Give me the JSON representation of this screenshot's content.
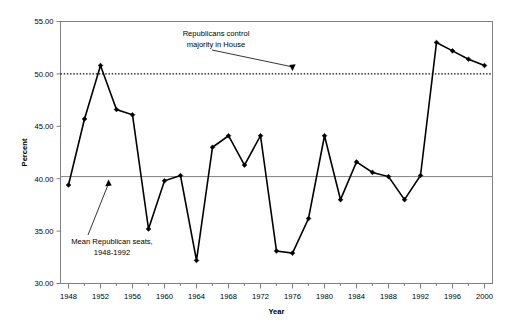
{
  "chart_data": {
    "type": "line",
    "title": "",
    "xlabel": "Year",
    "ylabel": "Percent",
    "xlim": [
      1947,
      2001
    ],
    "ylim": [
      30.0,
      55.0
    ],
    "grid": false,
    "legend_position": "none",
    "x": [
      1948,
      1950,
      1952,
      1954,
      1956,
      1958,
      1960,
      1962,
      1964,
      1966,
      1968,
      1970,
      1972,
      1974,
      1976,
      1978,
      1980,
      1982,
      1984,
      1986,
      1988,
      1990,
      1992,
      1994,
      1996,
      1998,
      2000
    ],
    "values": [
      39.4,
      45.7,
      50.8,
      46.6,
      46.1,
      35.2,
      39.8,
      40.3,
      32.2,
      43.0,
      44.1,
      41.3,
      44.1,
      33.1,
      32.9,
      36.2,
      44.1,
      38.0,
      41.6,
      40.6,
      40.2,
      38.0,
      40.3,
      53.0,
      52.2,
      51.4,
      50.8
    ],
    "series": [
      {
        "name": "Republican seats in House (percent)",
        "values": [
          39.4,
          45.7,
          50.8,
          46.6,
          46.1,
          35.2,
          39.8,
          40.3,
          32.2,
          43.0,
          44.1,
          41.3,
          44.1,
          33.1,
          32.9,
          36.2,
          44.1,
          38.0,
          41.6,
          40.6,
          40.2,
          38.0,
          40.3,
          53.0,
          52.2,
          51.4,
          50.8
        ]
      }
    ],
    "y_ticks": [
      "30.00",
      "35.00",
      "40.00",
      "45.00",
      "50.00",
      "55.00"
    ],
    "y_tick_values": [
      30.0,
      35.0,
      40.0,
      45.0,
      50.0,
      55.0
    ],
    "x_ticks": [
      "1948",
      "1952",
      "1956",
      "1960",
      "1964",
      "1968",
      "1972",
      "1976",
      "1980",
      "1984",
      "1988",
      "1992",
      "1996",
      "2000"
    ],
    "x_tick_values": [
      1948,
      1952,
      1956,
      1960,
      1964,
      1968,
      1972,
      1976,
      1980,
      1984,
      1988,
      1992,
      1996,
      2000
    ],
    "reference_lines": [
      {
        "name": "majority-line",
        "value": 50.0,
        "style": "dotted",
        "color": "#000000"
      },
      {
        "name": "mean-line",
        "value": 40.2,
        "style": "solid",
        "color": "#808080"
      }
    ],
    "annotations": [
      {
        "name": "majority-annotation",
        "lines": [
          "Republicans control",
          "majority in House"
        ],
        "target_value": 50.0,
        "target_year": 1976
      },
      {
        "name": "mean-annotation",
        "lines": [
          "Mean Republican seats,",
          "1948-1992"
        ],
        "target_value": 40.2,
        "target_year": 1953
      }
    ],
    "colors": {
      "line": "#000000",
      "marker": "#000000",
      "majority_line": "#000000",
      "mean_line": "#808080",
      "axis": "#808080",
      "plot_background": "#ffffff"
    }
  }
}
